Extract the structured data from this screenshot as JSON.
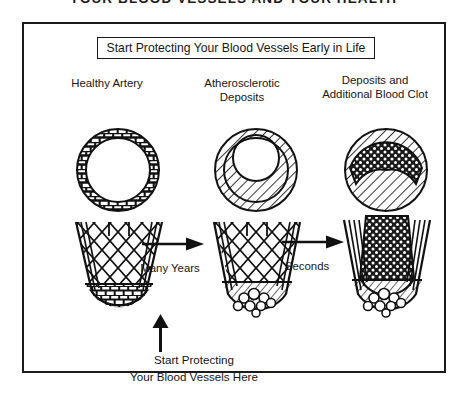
{
  "banner": {
    "title": "YOUR BLOOD VESSELS AND YOUR HEALTH"
  },
  "headline": {
    "text": "Start Protecting Your Blood Vessels Early in Life"
  },
  "columns": [
    {
      "label": "Healthy Artery"
    },
    {
      "label": "Atherosclerotic\nDeposits",
      "line1": "Atherosclerotic",
      "line2": "Deposits"
    },
    {
      "label": "Deposits and\nAdditional  Blood Clot",
      "line1": "Deposits and",
      "line2": "Additional  Blood Clot"
    }
  ],
  "transitions": [
    {
      "name": "many-years",
      "label": "Many Years",
      "direction": "right"
    },
    {
      "name": "seconds",
      "label": "Seconds",
      "direction": "right"
    }
  ],
  "callout": {
    "direction": "up",
    "line1": "Start Protecting",
    "line2": "Your Blood Vessels Here"
  },
  "colors": {
    "ink": "#1b1b1b",
    "background": "#ffffff",
    "clot": "#1a1a1a"
  },
  "figures": {
    "cross_sections": [
      {
        "stage": "healthy",
        "wall_pattern": "braided-weave",
        "lumen": "open"
      },
      {
        "stage": "atherosclerotic",
        "wall_pattern": "diagonal-hatch",
        "lumen": "narrowed-crescent"
      },
      {
        "stage": "clotted",
        "wall_pattern": "diagonal-hatch",
        "lumen": "occluded-stipple"
      }
    ],
    "longitudinal": [
      {
        "stage": "healthy",
        "pattern": "diamond-lattice",
        "base": "woven"
      },
      {
        "stage": "atherosclerotic",
        "pattern": "diamond-lattice",
        "base": "deposit-cluster"
      },
      {
        "stage": "clotted",
        "pattern": "dense-stipple",
        "base": "deposit-cluster"
      }
    ]
  }
}
